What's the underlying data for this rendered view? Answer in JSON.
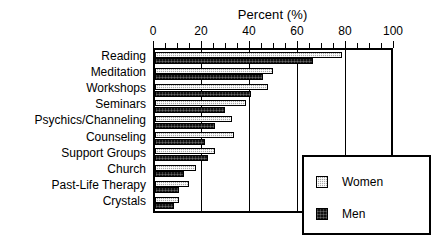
{
  "chart_data": {
    "type": "bar",
    "orientation": "horizontal",
    "title": "Percent (%)",
    "xlabel": "Percent (%)",
    "ylabel": "",
    "xlim": [
      0,
      100
    ],
    "xticks": [
      0,
      20,
      40,
      60,
      80,
      100
    ],
    "xtick_labels": [
      "0",
      "20",
      "40",
      "60",
      "80",
      "100"
    ],
    "minor_tick_step": 5,
    "grid": "vertical-major-only",
    "legend_position": "lower-right-inside",
    "categories": [
      "Reading",
      "Meditation",
      "Workshops",
      "Seminars",
      "Psychics/Channeling",
      "Counseling",
      "Support Groups",
      "Church",
      "Past-Life Therapy",
      "Crystals"
    ],
    "series": [
      {
        "name": "Women",
        "color": "#a8a8a8",
        "pattern": "light-dither",
        "values": [
          78,
          49,
          47,
          38,
          32,
          33,
          25,
          17,
          14,
          10
        ]
      },
      {
        "name": "Men",
        "color": "#121212",
        "pattern": "dark-dither",
        "values": [
          66,
          45,
          40,
          29,
          25,
          21,
          22,
          12,
          10,
          8
        ]
      }
    ]
  },
  "legend": {
    "entries": [
      {
        "label": "Women"
      },
      {
        "label": "Men"
      }
    ]
  },
  "colors": {
    "axis": "#000000",
    "background": "#ffffff",
    "women": "#a8a8a8",
    "men": "#121212"
  }
}
